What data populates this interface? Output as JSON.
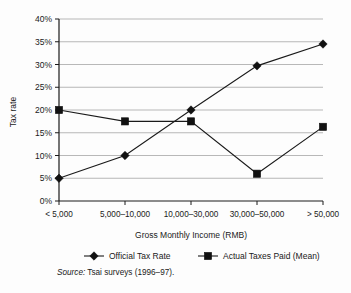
{
  "chart_data": {
    "type": "line",
    "title": "",
    "xlabel": "Gross Monthly Income (RMB)",
    "ylabel": "Tax rate",
    "categories": [
      "< 5,000",
      "5,000–10,000",
      "10,000–30,000",
      "30,000–50,000",
      "> 50,000"
    ],
    "ylim": [
      0,
      40
    ],
    "ytick_labels": [
      "0%",
      "5%",
      "10%",
      "15%",
      "20%",
      "25%",
      "30%",
      "35%",
      "40%"
    ],
    "ytick_values": [
      0,
      5,
      10,
      15,
      20,
      25,
      30,
      35,
      40
    ],
    "grid": true,
    "legend_position": "bottom",
    "series": [
      {
        "name": "Official Tax Rate",
        "marker": "diamond",
        "color": "#111111",
        "values": [
          5,
          10,
          20,
          29.7,
          34.5
        ]
      },
      {
        "name": "Actual Taxes Paid (Mean)",
        "marker": "square",
        "color": "#111111",
        "values": [
          20,
          17.5,
          17.5,
          6,
          16.3
        ]
      }
    ]
  },
  "source": {
    "label": "Source:",
    "text": "Tsai surveys (1996–97)."
  }
}
